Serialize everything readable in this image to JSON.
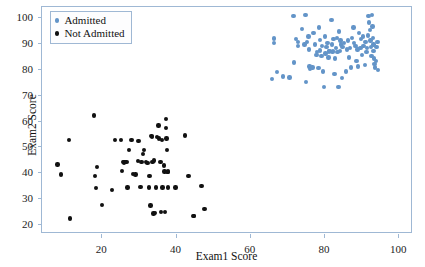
{
  "chart_data": {
    "type": "scatter",
    "title": "",
    "xlabel": "Exam1 Score",
    "ylabel": "Exam2 Score",
    "xlim": [
      4,
      104
    ],
    "ylim": [
      16,
      104
    ],
    "xticks": [
      20,
      40,
      60,
      80,
      100
    ],
    "yticks": [
      20,
      30,
      40,
      50,
      60,
      70,
      80,
      90,
      100
    ],
    "grid": false,
    "legend_position": "upper-left",
    "series": [
      {
        "name": "Admitted",
        "marker": "circle",
        "color": "#6394c8",
        "points": [
          [
            66.56,
            90.0
          ],
          [
            66.56,
            91.8
          ],
          [
            66.0,
            76.0
          ],
          [
            67.3,
            78.8
          ],
          [
            69.0,
            77.0
          ],
          [
            70.7,
            76.6
          ],
          [
            71.8,
            100.5
          ],
          [
            72.4,
            91.5
          ],
          [
            72.0,
            82.5
          ],
          [
            73.0,
            88.9
          ],
          [
            73.0,
            90.5
          ],
          [
            74.0,
            95.5
          ],
          [
            74.8,
            89.5
          ],
          [
            75.0,
            101.0
          ],
          [
            75.2,
            74.9
          ],
          [
            75.5,
            90.5
          ],
          [
            75.8,
            92.5
          ],
          [
            76.0,
            87.5
          ],
          [
            76.1,
            81.0
          ],
          [
            76.3,
            80.0
          ],
          [
            76.9,
            80.5
          ],
          [
            77.2,
            94.0
          ],
          [
            77.6,
            89.5
          ],
          [
            78.0,
            85.5
          ],
          [
            78.2,
            86.5
          ],
          [
            78.5,
            80.3
          ],
          [
            78.6,
            96.0
          ],
          [
            79.0,
            91.2
          ],
          [
            79.0,
            87.2
          ],
          [
            79.3,
            85.0
          ],
          [
            79.5,
            89.0
          ],
          [
            79.8,
            79.0
          ],
          [
            80.0,
            73.0
          ],
          [
            80.2,
            92.5
          ],
          [
            80.4,
            86.0
          ],
          [
            80.7,
            88.5
          ],
          [
            81.0,
            90.0
          ],
          [
            81.2,
            84.5
          ],
          [
            81.4,
            86.8
          ],
          [
            81.5,
            87.0
          ],
          [
            82.0,
            99.0
          ],
          [
            82.1,
            89.5
          ],
          [
            82.3,
            86.5
          ],
          [
            82.4,
            87.0
          ],
          [
            82.6,
            91.5
          ],
          [
            82.8,
            78.0
          ],
          [
            83.0,
            84.0
          ],
          [
            83.2,
            88.0
          ],
          [
            83.5,
            92.0
          ],
          [
            83.7,
            86.5
          ],
          [
            83.9,
            73.0
          ],
          [
            84.0,
            94.5
          ],
          [
            84.3,
            87.0
          ],
          [
            84.5,
            91.0
          ],
          [
            84.6,
            89.5
          ],
          [
            84.8,
            76.5
          ],
          [
            85.0,
            88.5
          ],
          [
            85.4,
            90.0
          ],
          [
            85.9,
            79.0
          ],
          [
            86.2,
            87.5
          ],
          [
            86.5,
            91.0
          ],
          [
            86.8,
            84.5
          ],
          [
            87.0,
            88.0
          ],
          [
            87.3,
            80.5
          ],
          [
            87.5,
            92.0
          ],
          [
            88.0,
            96.0
          ],
          [
            88.1,
            90.0
          ],
          [
            88.5,
            89.0
          ],
          [
            88.8,
            83.0
          ],
          [
            89.0,
            87.5
          ],
          [
            89.5,
            94.0
          ],
          [
            89.8,
            88.0
          ],
          [
            90.0,
            91.5
          ],
          [
            90.3,
            85.5
          ],
          [
            90.5,
            92.5
          ],
          [
            90.7,
            89.0
          ],
          [
            91.0,
            81.5
          ],
          [
            91.2,
            90.5
          ],
          [
            91.5,
            86.5
          ],
          [
            91.6,
            88.0
          ],
          [
            91.8,
            93.0
          ],
          [
            92.0,
            100.5
          ],
          [
            92.2,
            98.0
          ],
          [
            92.4,
            95.0
          ],
          [
            92.5,
            91.0
          ],
          [
            92.7,
            88.5
          ],
          [
            92.8,
            85.0
          ],
          [
            93.0,
            100.8
          ],
          [
            93.1,
            96.5
          ],
          [
            93.2,
            92.0
          ],
          [
            93.3,
            89.5
          ],
          [
            93.4,
            87.0
          ],
          [
            93.5,
            84.0
          ],
          [
            93.6,
            82.0
          ],
          [
            93.7,
            80.5
          ],
          [
            94.0,
            83.0
          ],
          [
            94.2,
            88.5
          ],
          [
            94.4,
            90.5
          ],
          [
            94.5,
            79.5
          ],
          [
            89.2,
            81.0
          ]
        ]
      },
      {
        "name": "Not Admitted",
        "marker": "circle",
        "color": "#111111",
        "points": [
          [
            8.2,
            43.0
          ],
          [
            9.1,
            39.0
          ],
          [
            11.2,
            52.5
          ],
          [
            11.5,
            22.0
          ],
          [
            18.0,
            62.0
          ],
          [
            18.3,
            38.5
          ],
          [
            18.5,
            33.8
          ],
          [
            18.9,
            42.0
          ],
          [
            20.2,
            27.2
          ],
          [
            22.9,
            33.0
          ],
          [
            23.6,
            52.5
          ],
          [
            25.3,
            52.5
          ],
          [
            25.6,
            40.4
          ],
          [
            25.9,
            44.0
          ],
          [
            26.1,
            43.7
          ],
          [
            26.4,
            44.0
          ],
          [
            26.8,
            43.8
          ],
          [
            27.0,
            34.0
          ],
          [
            27.5,
            48.6
          ],
          [
            28.1,
            52.5
          ],
          [
            28.5,
            39.2
          ],
          [
            29.2,
            39.0
          ],
          [
            30.0,
            52.0
          ],
          [
            30.5,
            34.2
          ],
          [
            31.2,
            47.0
          ],
          [
            31.5,
            48.5
          ],
          [
            32.0,
            44.0
          ],
          [
            32.4,
            43.5
          ],
          [
            32.8,
            34.0
          ],
          [
            33.0,
            38.5
          ],
          [
            33.2,
            27.0
          ],
          [
            33.5,
            54.0
          ],
          [
            33.6,
            53.5
          ],
          [
            33.8,
            44.0
          ],
          [
            34.0,
            24.0
          ],
          [
            34.4,
            24.1
          ],
          [
            34.8,
            34.0
          ],
          [
            35.0,
            53.5
          ],
          [
            35.4,
            58.0
          ],
          [
            35.6,
            53.0
          ],
          [
            35.9,
            44.0
          ],
          [
            36.0,
            24.5
          ],
          [
            36.3,
            52.5
          ],
          [
            36.5,
            34.0
          ],
          [
            36.8,
            42.5
          ],
          [
            37.0,
            40.2
          ],
          [
            37.2,
            24.5
          ],
          [
            37.4,
            57.0
          ],
          [
            37.5,
            60.5
          ],
          [
            37.6,
            53.0
          ],
          [
            37.7,
            48.6
          ],
          [
            37.8,
            40.0
          ],
          [
            37.9,
            34.0
          ],
          [
            38.0,
            40.3
          ],
          [
            42.5,
            54.2
          ],
          [
            43.5,
            38.5
          ],
          [
            44.8,
            23.0
          ],
          [
            45.0,
            22.9
          ],
          [
            47.0,
            34.6
          ],
          [
            47.8,
            25.6
          ],
          [
            40.0,
            34.0
          ],
          [
            34.2,
            44.5
          ],
          [
            30.8,
            44.0
          ],
          [
            29.8,
            44.2
          ]
        ]
      }
    ]
  },
  "legend": {
    "entries": [
      {
        "label": "Admitted",
        "color": "#6394c8"
      },
      {
        "label": "Not Admitted",
        "color": "#111111"
      }
    ]
  },
  "axes": {
    "x_title": "Exam1 Score",
    "y_title": "Exam2 Score",
    "x_tick_labels": [
      "20",
      "40",
      "60",
      "80",
      "100"
    ],
    "y_tick_labels": [
      "20",
      "30",
      "40",
      "50",
      "60",
      "70",
      "80",
      "90",
      "100"
    ]
  },
  "colors": {
    "admitted": "#6394c8",
    "not_admitted": "#111111",
    "frame": "#9fb8d4",
    "background": "#ffffff"
  }
}
